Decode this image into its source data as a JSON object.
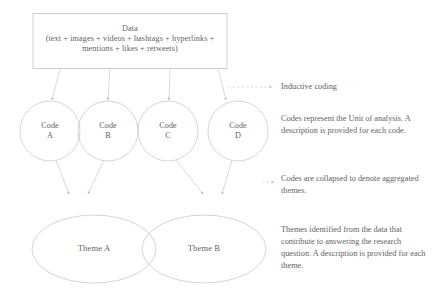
{
  "diagram": {
    "stroke_color": "#bdbdbd",
    "text_color": "#5f5f5f",
    "background": "#ffffff"
  },
  "data_box": {
    "name": "Data",
    "title": "Data",
    "detail": "(text + images + videos + hashtags + hyperlinks +",
    "detail2": "mentions + likes + retweets)"
  },
  "codes": [
    {
      "line1": "Code",
      "line2": "A",
      "full": "Code A"
    },
    {
      "line1": "Code",
      "line2": "B",
      "full": "Code B"
    },
    {
      "line1": "Code",
      "line2": "C",
      "full": "Code C"
    },
    {
      "line1": "Code",
      "line2": "D",
      "full": "Code D"
    }
  ],
  "themes": [
    {
      "label": "Theme A"
    },
    {
      "label": "Theme B"
    }
  ],
  "annotations": {
    "inductive": "Inductive coding",
    "codes_meaning": "Codes represent the Unit of analysis. A description is provided for each code.",
    "collapse": "Codes are collapsed to denote aggregated themes.",
    "themes_meaning": "Themes identified from the data that contribute to answering the research question. A description is provided for each theme."
  }
}
